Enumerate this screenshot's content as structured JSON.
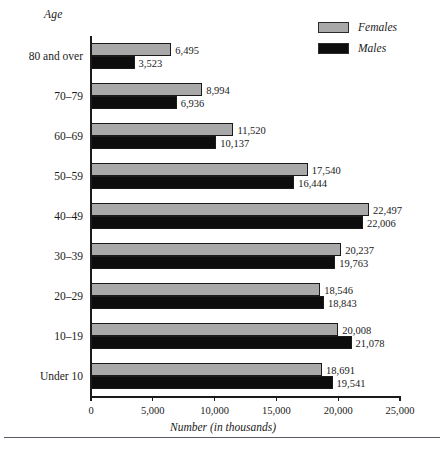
{
  "chart_data": {
    "type": "bar",
    "orientation": "horizontal",
    "title": "",
    "xlabel": "Number (in thousands)",
    "ylabel": "Age",
    "xlim": [
      0,
      25000
    ],
    "xticks": [
      0,
      5000,
      10000,
      15000,
      20000,
      25000
    ],
    "xtick_labels": [
      "0",
      "5,000",
      "10,000",
      "15,000",
      "20,000",
      "25,000"
    ],
    "grid": false,
    "legend_position": "top-right",
    "categories": [
      "80 and over",
      "70–79",
      "60–69",
      "50–59",
      "40–49",
      "30–39",
      "20–29",
      "10–19",
      "Under 10"
    ],
    "series": [
      {
        "name": "Females",
        "color": "#a9a9a9",
        "values": [
          6495,
          8994,
          11520,
          17540,
          22497,
          20237,
          18546,
          20008,
          18691
        ],
        "value_labels": [
          "6,495",
          "8,994",
          "11,520",
          "17,540",
          "22,497",
          "20,237",
          "18,546",
          "20,008",
          "18,691"
        ]
      },
      {
        "name": "Males",
        "color": "#0d0d0d",
        "values": [
          3523,
          6936,
          10137,
          16444,
          22006,
          19763,
          18843,
          21078,
          19541
        ],
        "value_labels": [
          "3,523",
          "6,936",
          "10,137",
          "16,444",
          "22,006",
          "19,763",
          "18,843",
          "21,078",
          "19,541"
        ]
      }
    ]
  },
  "legend": {
    "items": [
      {
        "label": "Females",
        "swatch_color": "#a9a9a9"
      },
      {
        "label": "Males",
        "swatch_color": "#0d0d0d"
      }
    ]
  },
  "axis": {
    "y_title": "Age",
    "x_caption": "Number (in thousands)"
  }
}
